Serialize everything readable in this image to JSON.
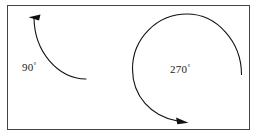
{
  "figure": {
    "type": "geometry-diagram",
    "title": "",
    "background_color": "#ffffff",
    "frame": {
      "stroke_color": "#444444",
      "x": 7,
      "y": 5,
      "width": 243,
      "height": 125
    },
    "stroke_color": "#111111",
    "items": [
      {
        "name": "ninety-degree-arc",
        "label": "90",
        "degree_symbol": "°",
        "label_text": "90°",
        "angle_degrees": 90,
        "direction": "counterclockwise",
        "arrow_position": "start-top-left",
        "label_x": 22,
        "label_y": 71
      },
      {
        "name": "two-seventy-degree-arc",
        "label": "270",
        "degree_symbol": "°",
        "label_text": "270°",
        "angle_degrees": 270,
        "direction": "counterclockwise",
        "arrow_position": "end-bottom-right",
        "label_x": 171,
        "label_y": 73
      }
    ]
  }
}
